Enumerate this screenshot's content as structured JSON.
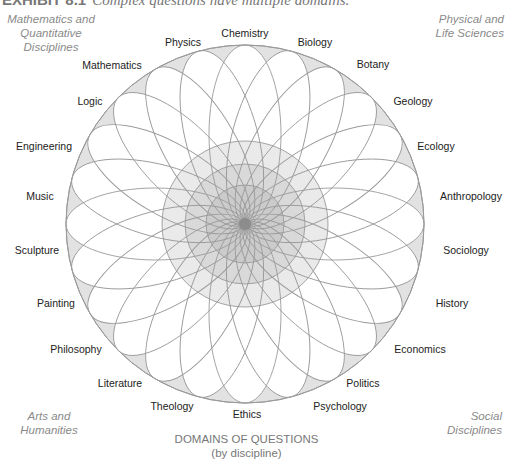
{
  "figure": {
    "exhibit_label": "EXHIBIT 8.1",
    "caption": "Complex questions have multiple domains."
  },
  "corners": {
    "top_left": [
      "Mathematics and",
      "Quantitative",
      "Disciplines"
    ],
    "top_right": [
      "Physical and",
      "Life Sciences"
    ],
    "bottom_left": [
      "Arts and",
      "Humanities"
    ],
    "bottom_right": [
      "Social",
      "Disciplines"
    ]
  },
  "axis_title": {
    "line1": "DOMAINS OF QUESTIONS",
    "line2": "(by discipline)"
  },
  "diagram": {
    "center": [
      245,
      224
    ],
    "outer_radius": 179,
    "petal_semi_major": 89.5,
    "petal_semi_minor": 36,
    "petal_count": 24,
    "colors": {
      "outer_fill": "#e2e2e2",
      "petal_fill": "#ffffff",
      "stroke": "#9a9a9a",
      "ring_1": "#e6e6e6",
      "ring_2": "#d6d6d6",
      "ring_3": "#c8c8c8",
      "core": "#8c8c8c"
    },
    "rings": [
      83,
      60,
      39
    ],
    "core_radius": 6
  },
  "disciplines": [
    {
      "name": "Chemistry",
      "x": 245,
      "y": 37,
      "anchor": "middle"
    },
    {
      "name": "Biology",
      "x": 315,
      "y": 46,
      "anchor": "middle"
    },
    {
      "name": "Botany",
      "x": 373,
      "y": 68,
      "anchor": "middle"
    },
    {
      "name": "Geology",
      "x": 413,
      "y": 105,
      "anchor": "middle"
    },
    {
      "name": "Ecology",
      "x": 436,
      "y": 150,
      "anchor": "middle"
    },
    {
      "name": "Anthropology",
      "x": 471,
      "y": 200,
      "anchor": "middle"
    },
    {
      "name": "Sociology",
      "x": 466,
      "y": 254,
      "anchor": "middle"
    },
    {
      "name": "History",
      "x": 452,
      "y": 307,
      "anchor": "middle"
    },
    {
      "name": "Economics",
      "x": 420,
      "y": 353,
      "anchor": "middle"
    },
    {
      "name": "Politics",
      "x": 363,
      "y": 387,
      "anchor": "middle"
    },
    {
      "name": "Psychology",
      "x": 340,
      "y": 410,
      "anchor": "middle"
    },
    {
      "name": "Ethics",
      "x": 247,
      "y": 418,
      "anchor": "middle"
    },
    {
      "name": "Theology",
      "x": 172,
      "y": 410,
      "anchor": "middle"
    },
    {
      "name": "Literature",
      "x": 120,
      "y": 387,
      "anchor": "middle"
    },
    {
      "name": "Philosophy",
      "x": 76,
      "y": 353,
      "anchor": "middle"
    },
    {
      "name": "Painting",
      "x": 56,
      "y": 307,
      "anchor": "middle"
    },
    {
      "name": "Sculpture",
      "x": 37,
      "y": 254,
      "anchor": "middle"
    },
    {
      "name": "Music",
      "x": 40,
      "y": 200,
      "anchor": "middle"
    },
    {
      "name": "Engineering",
      "x": 44,
      "y": 150,
      "anchor": "middle"
    },
    {
      "name": "Logic",
      "x": 90,
      "y": 105,
      "anchor": "middle"
    },
    {
      "name": "Mathematics",
      "x": 112,
      "y": 69,
      "anchor": "middle"
    },
    {
      "name": "Physics",
      "x": 183,
      "y": 46,
      "anchor": "middle"
    }
  ]
}
